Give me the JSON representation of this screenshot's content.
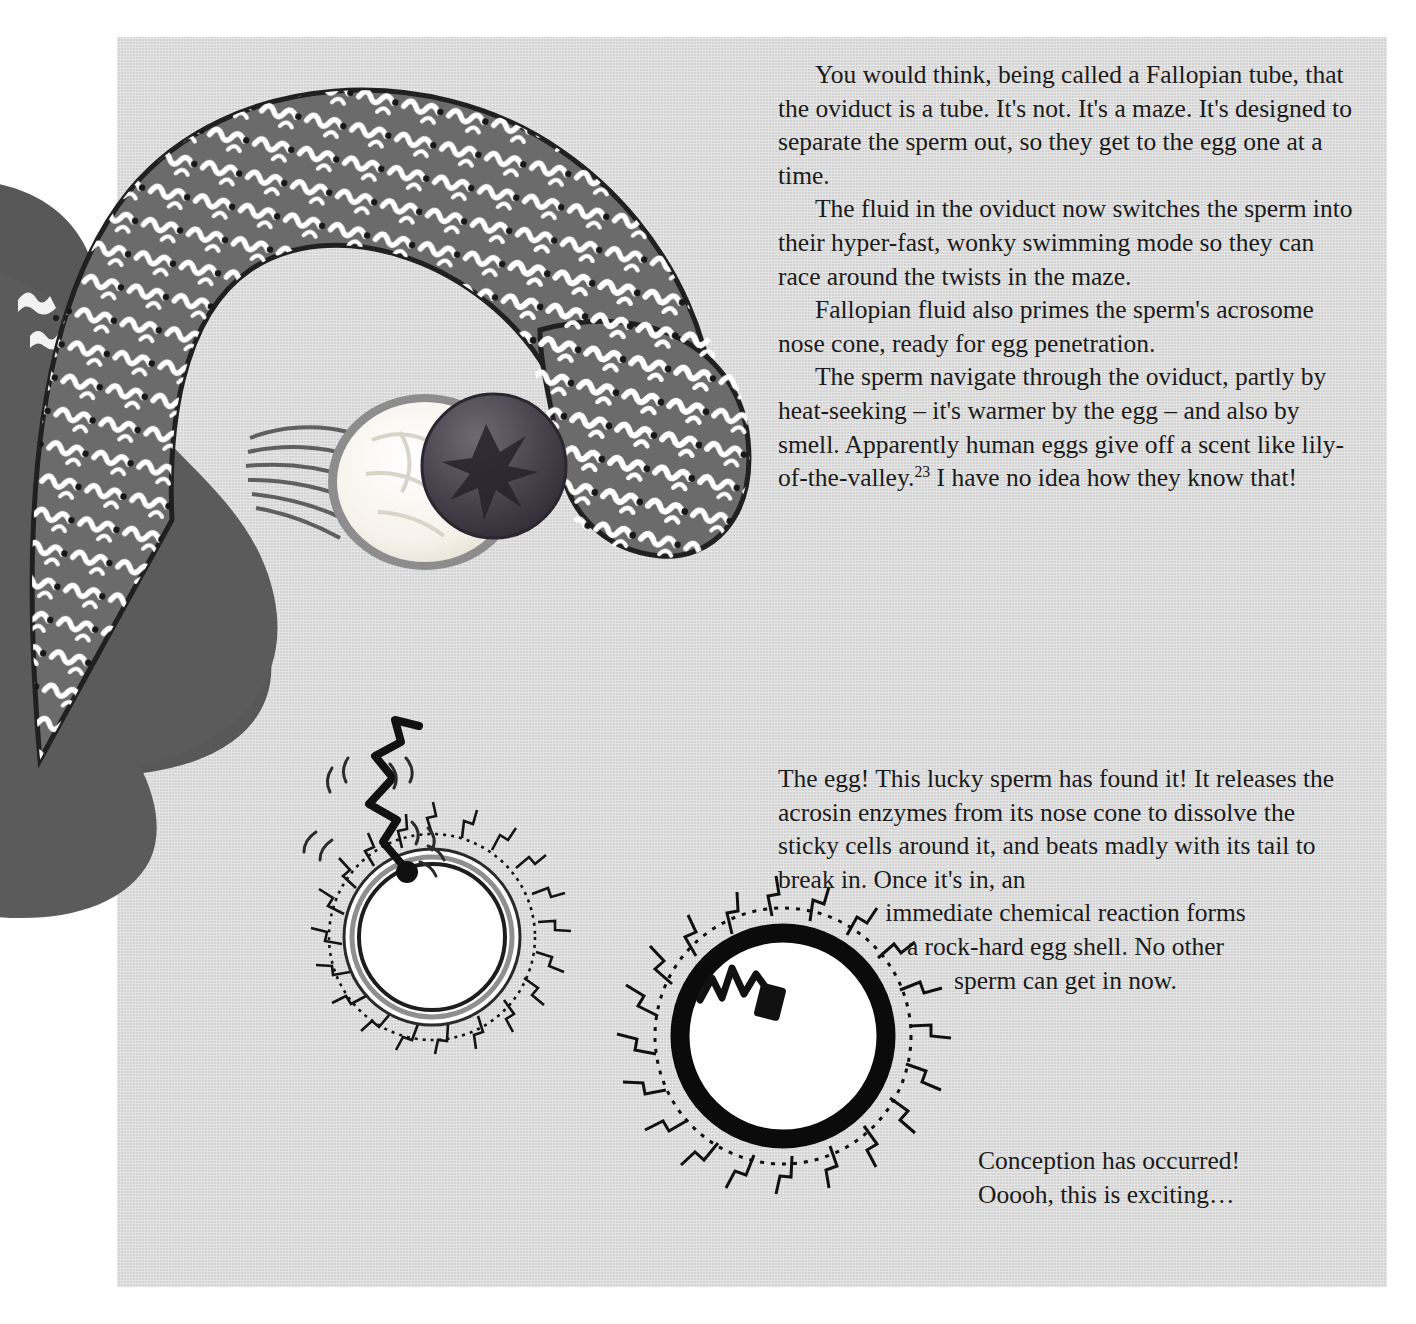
{
  "page": {
    "background_color": "#ffffff",
    "panel_color": "#d4d4d4",
    "text_color": "#1b1b1b",
    "running_head": "",
    "width": 1416,
    "height": 1324
  },
  "text_blocks": [
    {
      "id": "text-block-1",
      "paragraphs": [
        "You would think, being called a Fallopian tube, that the oviduct is a tube. It's not. It's a maze. It's designed to separate the sperm out, so they get to the egg one at a time.",
        "The fluid in the oviduct now switches the sperm into their hyper-fast, wonky swimming mode so they can race around the twists in the maze.",
        "Fallopian fluid also primes the sperm's acrosome nose cone, ready for egg penetration.",
        "The sperm navigate through the oviduct, partly by heat-seeking – it's warmer by the egg – and also by smell. Apparently human eggs give off a scent like lily-of-the-valley."
      ],
      "footnote_marker": "23",
      "tail_text": " I have no idea how they know that!"
    },
    {
      "id": "text-block-2",
      "lead": "The egg! This lucky sperm has found it! It releases the acrosin enzymes from its nose cone to dissolve the sticky cells around it, and beats madly with its tail to break in. Once it's in, an",
      "centered_lines": [
        "immediate chemical reaction forms",
        "a rock-hard egg shell. No other",
        "sperm can get in now."
      ]
    },
    {
      "id": "text-block-3",
      "lines": [
        "Conception has occurred!",
        "Ooooh, this is exciting…"
      ]
    }
  ],
  "illustrations": {
    "fallopian_diagram": {
      "name": "fallopian-tube-and-ovary-diagram",
      "parts": [
        {
          "name": "uterus-body",
          "color": "#5a5a5a"
        },
        {
          "name": "fallopian-tube-arc",
          "color": "#666666"
        },
        {
          "name": "sperm-swarm-in-tube",
          "color": "#ffffff"
        },
        {
          "name": "ampulla-bulb",
          "color": "#6a6a6a"
        },
        {
          "name": "ovary",
          "color": "#f7f4ee"
        },
        {
          "name": "released-egg-follicle",
          "color": "#4a4a52"
        },
        {
          "name": "fimbriae-strands",
          "color": "#6e6e6e"
        }
      ]
    },
    "egg_unfertilised": {
      "name": "unfertilised-egg-with-sperm",
      "parts": [
        {
          "name": "corona-radiata-spikes",
          "color": "#111111"
        },
        {
          "name": "zona-pellucida-ring",
          "color": "#8a8a8a"
        },
        {
          "name": "egg-cytoplasm",
          "color": "#ffffff"
        },
        {
          "name": "sperm-head",
          "color": "#111111"
        },
        {
          "name": "sperm-tail",
          "color": "#111111"
        },
        {
          "name": "motion-lines",
          "color": "#333333"
        }
      ]
    },
    "egg_fertilised": {
      "name": "fertilised-egg-with-hard-shell",
      "parts": [
        {
          "name": "corona-radiata-spikes",
          "color": "#111111"
        },
        {
          "name": "rock-hard-shell-ring",
          "color": "#0b0b0b"
        },
        {
          "name": "egg-cytoplasm",
          "color": "#ffffff"
        },
        {
          "name": "sperm-inside",
          "color": "#111111"
        }
      ]
    }
  }
}
